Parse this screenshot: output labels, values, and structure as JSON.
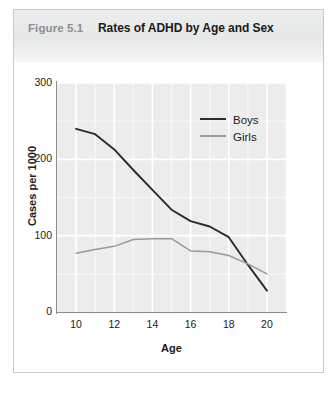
{
  "figure": {
    "label": "Figure 5.1",
    "title": "Rates of ADHD by Age and Sex"
  },
  "colors": {
    "boys_line": "#2b2b2b",
    "girls_line": "#9a9a9a",
    "plot_background": "#ececec",
    "gridline": "#ffffff",
    "minor_gridline": "#f6f6f6",
    "axis": "#8a8a8a",
    "header_background": "#e9eaea",
    "label_gray": "#8d8f92",
    "text": "#1b1b1b",
    "border": "#c9c9c9"
  },
  "legend": {
    "position": "top-right",
    "entries": [
      {
        "name": "Boys",
        "color": "#2b2b2b"
      },
      {
        "name": "Girls",
        "color": "#9a9a9a"
      }
    ]
  },
  "axes": {
    "y_title": "Cases per 1000",
    "x_title": "Age",
    "y_ticks": [
      "0",
      "100",
      "200",
      "300"
    ],
    "x_ticks": [
      "10",
      "12",
      "14",
      "16",
      "18",
      "20"
    ]
  },
  "chart_data": {
    "type": "line",
    "title": "Rates of ADHD by Age and Sex",
    "subtitle": "Figure 5.1",
    "xlabel": "Age",
    "ylabel": "Cases per 1000",
    "xlim": [
      9,
      21
    ],
    "ylim": [
      0,
      300
    ],
    "xticks": [
      10,
      12,
      14,
      16,
      18,
      20
    ],
    "yticks": [
      0,
      100,
      200,
      300
    ],
    "grid": true,
    "minor_grid_x": [
      9,
      11,
      13,
      15,
      17,
      19,
      21
    ],
    "minor_grid_y": [
      50,
      150,
      250
    ],
    "legend_position": "upper right",
    "x": [
      10,
      11,
      12,
      13,
      14,
      15,
      16,
      17,
      18,
      19,
      20
    ],
    "series": [
      {
        "name": "Boys",
        "color": "#2b2b2b",
        "values": [
          240,
          233,
          213,
          186,
          160,
          134,
          119,
          112,
          98,
          62,
          28
        ]
      },
      {
        "name": "Girls",
        "color": "#9a9a9a",
        "values": [
          77,
          82,
          86,
          95,
          96,
          96,
          80,
          79,
          74,
          63,
          50
        ]
      }
    ]
  }
}
